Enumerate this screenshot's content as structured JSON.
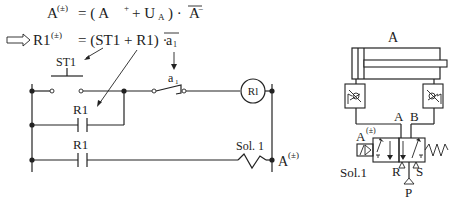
{
  "equations": {
    "eq1": {
      "lhs": "A",
      "lhs_sup": "(±)",
      "rhs": "= ( A",
      "plus_sup": "+",
      "rest": "+ U",
      "sub": "A",
      "close": ") ·",
      "bar_term": "A",
      "bar_sup": "−"
    },
    "eq2": {
      "lhs": "R1",
      "lhs_sup": "(±)",
      "rhs": "= (ST1 + R1) ·",
      "bar_term": "a",
      "bar_sub": "1"
    }
  },
  "ladder": {
    "pushbutton_label": "ST1",
    "limit_switch_label": "a",
    "limit_switch_sub": "1",
    "coil_label": "Rl",
    "contact1_label": "R1",
    "contact2_label": "R1",
    "solenoid_label": "Sol. 1",
    "output_label": "A",
    "output_sup": "(±)"
  },
  "pneumatic": {
    "cylinder_label": "A",
    "port_a": "A",
    "port_b": "B",
    "port_r": "R",
    "port_s": "S",
    "port_p": "P",
    "valve_signal_label": "A",
    "valve_signal_sup": "(±)",
    "solenoid_label": "Sol.1"
  }
}
